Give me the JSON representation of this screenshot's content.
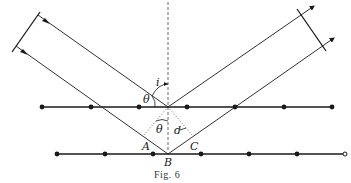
{
  "figure": {
    "caption": "Fig. 6",
    "labels": {
      "angle_incidence": "i",
      "theta_upper": "θ",
      "theta_lower": "θ",
      "spacing": "d",
      "point_A": "A",
      "point_B": "B",
      "point_C": "C"
    },
    "colors": {
      "ink": "#1a1a1a",
      "background": "#ffffff"
    },
    "lattice_rows": [
      {
        "name": "upper",
        "y": 107,
        "x_start": 42,
        "x_end": 332,
        "atoms_x": [
          42,
          91,
          139,
          187,
          235,
          284,
          332
        ]
      },
      {
        "name": "lower",
        "y": 154,
        "x_start": 57,
        "x_end": 345,
        "atoms_x": [
          57,
          105,
          153,
          201,
          249,
          297
        ],
        "open_end_x": 345
      }
    ]
  }
}
